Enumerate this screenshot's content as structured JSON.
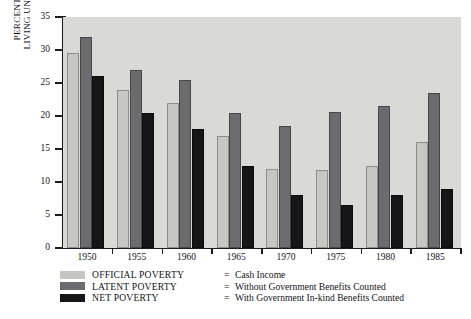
{
  "chart_data": {
    "type": "bar",
    "title": "",
    "subtitle": "",
    "xlabel": "",
    "ylabel": "PERCENTAGE OF PERSONS LIVING UNDER POVERTY LINE",
    "ylabel_lines": [
      "PERCENTAGE OF PERSONS",
      "LIVING UNDER POVERTY LINE"
    ],
    "categories": [
      "1950",
      "1955",
      "1960",
      "1965",
      "1970",
      "1975",
      "1980",
      "1985"
    ],
    "series": [
      {
        "name": "OFFICIAL POVERTY",
        "color": "#c6c6c2",
        "values": [
          29.5,
          24.0,
          22.0,
          17.0,
          12.0,
          11.8,
          12.5,
          16.0
        ]
      },
      {
        "name": "LATENT POVERTY",
        "color": "#6c6c70",
        "values": [
          32.0,
          27.0,
          25.5,
          20.5,
          18.5,
          20.6,
          21.5,
          23.5
        ]
      },
      {
        "name": "NET POVERTY",
        "color": "#161619",
        "values": [
          26.0,
          20.5,
          18.0,
          12.5,
          8.0,
          6.5,
          8.0,
          9.0
        ]
      }
    ],
    "ylim": [
      0,
      35
    ],
    "yticks": [
      0,
      5,
      10,
      15,
      20,
      25,
      30,
      35
    ],
    "ytick_labels": [
      "0",
      "5",
      "10",
      "15",
      "20",
      "25",
      "30",
      "35"
    ],
    "grid": false,
    "legend_position": "below-plot",
    "plot_background": "#d9d9d6",
    "axis_color": "#1b1b20"
  },
  "legend": {
    "equals": "=",
    "entries": [
      {
        "swatch": "official",
        "name": "OFFICIAL POVERTY",
        "description": "Cash Income"
      },
      {
        "swatch": "latent",
        "name": "LATENT POVERTY",
        "description": "Without Government Benefits Counted"
      },
      {
        "swatch": "net",
        "name": "NET POVERTY",
        "description": "With Government In-kind Benefits Counted"
      }
    ]
  }
}
